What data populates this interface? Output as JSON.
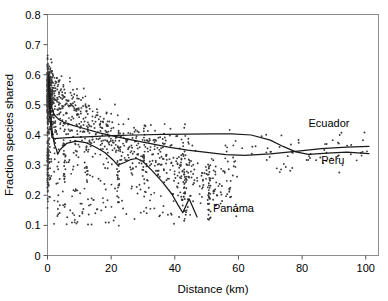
{
  "chart_data": {
    "type": "scatter",
    "title": "",
    "xlabel": "Distance (km)",
    "ylabel": "Fraction species shared",
    "xlim": [
      0,
      104
    ],
    "ylim": [
      0,
      0.8
    ],
    "xticks": [
      0,
      20,
      40,
      60,
      80,
      100
    ],
    "xtick_labels": [
      "0",
      "20",
      "40",
      "60",
      "80",
      "100"
    ],
    "yticks": [
      0,
      0.1,
      0.2,
      0.3,
      0.4,
      0.5,
      0.6,
      0.7,
      0.8
    ],
    "ytick_labels": [
      "0",
      "0.1",
      "0.2",
      "0.3",
      "0.4",
      "0.5",
      "0.6",
      "0.7",
      "0.8"
    ],
    "grid": false,
    "legend": "inline-annotations",
    "marker_color": "#3a3a3a",
    "line_color": "#1a1a1a",
    "annotations": [
      {
        "text": "Ecuador",
        "x": 82,
        "y": 0.425
      },
      {
        "text": "Peru",
        "x": 86,
        "y": 0.305
      },
      {
        "text": "Panama",
        "x": 52,
        "y": 0.145
      }
    ],
    "series": [
      {
        "name": "Ecuador",
        "type": "line",
        "points": [
          [
            0.4,
            0.6
          ],
          [
            1.0,
            0.505
          ],
          [
            2.0,
            0.468
          ],
          [
            3.5,
            0.452
          ],
          [
            5.0,
            0.443
          ],
          [
            8.0,
            0.432
          ],
          [
            12.0,
            0.42
          ],
          [
            16.0,
            0.408
          ],
          [
            20.0,
            0.398
          ],
          [
            26.0,
            0.385
          ],
          [
            32.0,
            0.372
          ],
          [
            38.0,
            0.36
          ],
          [
            44.0,
            0.35
          ],
          [
            50.0,
            0.342
          ],
          [
            56.0,
            0.335
          ],
          [
            62.0,
            0.332
          ],
          [
            70.0,
            0.337
          ],
          [
            78.0,
            0.346
          ],
          [
            86.0,
            0.355
          ],
          [
            94.0,
            0.36
          ],
          [
            101.0,
            0.362
          ]
        ]
      },
      {
        "name": "Peru",
        "type": "line",
        "points": [
          [
            0.3,
            0.585
          ],
          [
            0.8,
            0.452
          ],
          [
            1.4,
            0.392
          ],
          [
            2.2,
            0.388
          ],
          [
            4.0,
            0.39
          ],
          [
            8.0,
            0.392
          ],
          [
            14.0,
            0.395
          ],
          [
            20.0,
            0.398
          ],
          [
            28.0,
            0.4
          ],
          [
            36.0,
            0.402
          ],
          [
            44.0,
            0.403
          ],
          [
            52.0,
            0.404
          ],
          [
            58.0,
            0.404
          ],
          [
            64.0,
            0.4
          ],
          [
            70.0,
            0.383
          ],
          [
            74.0,
            0.362
          ],
          [
            78.0,
            0.344
          ],
          [
            82.0,
            0.336
          ],
          [
            88.0,
            0.34
          ],
          [
            94.0,
            0.343
          ],
          [
            101.0,
            0.338
          ]
        ]
      },
      {
        "name": "Panama",
        "type": "line",
        "points": [
          [
            0.4,
            0.575
          ],
          [
            1.0,
            0.47
          ],
          [
            1.6,
            0.4
          ],
          [
            2.2,
            0.368
          ],
          [
            2.8,
            0.352
          ],
          [
            3.2,
            0.336
          ],
          [
            4.0,
            0.352
          ],
          [
            6.0,
            0.372
          ],
          [
            9.0,
            0.38
          ],
          [
            12.0,
            0.375
          ],
          [
            15.0,
            0.36
          ],
          [
            18.0,
            0.342
          ],
          [
            20.5,
            0.318
          ],
          [
            22.0,
            0.3
          ],
          [
            24.0,
            0.308
          ],
          [
            26.0,
            0.318
          ],
          [
            28.0,
            0.322
          ],
          [
            30.0,
            0.312
          ],
          [
            33.0,
            0.28
          ],
          [
            36.0,
            0.245
          ],
          [
            39.0,
            0.205
          ],
          [
            41.0,
            0.168
          ],
          [
            42.5,
            0.142
          ],
          [
            44.5,
            0.188
          ],
          [
            47.0,
            0.128
          ]
        ]
      }
    ],
    "scatter_note": "Dense cloud of small point markers, heaviest near x=0 where values span 0.05-0.78, thinning with distance; bulk of points between 0.1 and 0.55."
  },
  "axes": {
    "x_title": "Distance (km)",
    "y_title": "Fraction species shared"
  }
}
